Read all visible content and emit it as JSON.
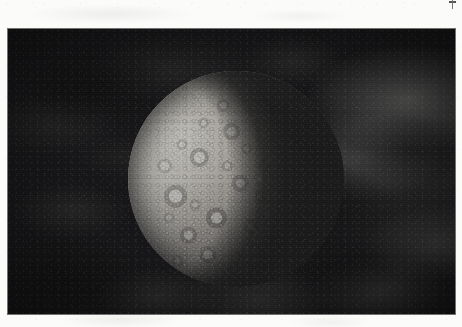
{
  "page": {
    "kind": "scanned-page",
    "paper_color": "#fbfbf9",
    "margin_note": "",
    "corner_mark": {
      "name": "stray-ink-mark",
      "label": ""
    }
  },
  "photo": {
    "caption": "",
    "alt_text": "Black-and-white photograph of a heavily cratered planetary body, lit from the left, against a mottled nebulous starfield",
    "subject": "cratered planetary body",
    "frame_color": "#060608",
    "background_color": "#08080a",
    "geometry": {
      "left_px": 8,
      "top_px": 29,
      "width_px": 447,
      "height_px": 285
    }
  },
  "planet": {
    "name": "planetary-disc",
    "label": "",
    "lit_side": "left",
    "terminator_side": "right",
    "surface": "heavily cratered",
    "highlight_color": "#d8d5cd",
    "midtone_color": "#94908a",
    "shadow_color": "#0a0a0b",
    "geometry": {
      "left_px": 120,
      "top_px": 42,
      "diameter_px": 216
    }
  }
}
